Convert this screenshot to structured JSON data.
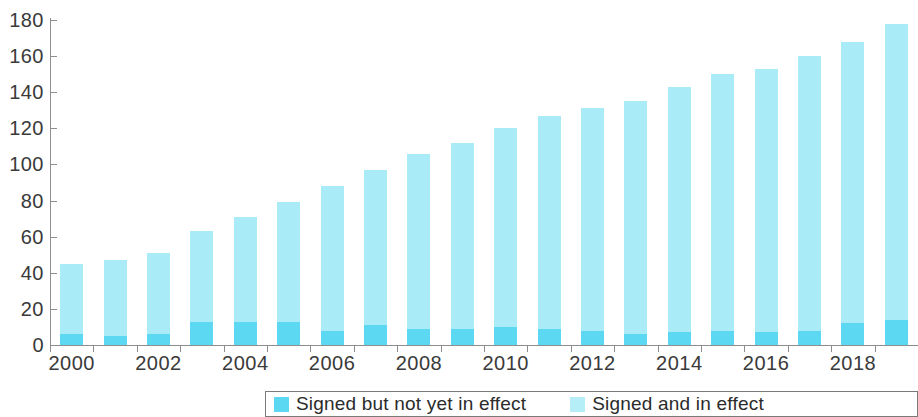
{
  "chart_data": {
    "type": "bar",
    "subtype": "stacked-bar",
    "title": "",
    "xlabel": "",
    "ylabel": "",
    "ylim": [
      0,
      180
    ],
    "yticks": [
      0,
      20,
      40,
      60,
      80,
      100,
      120,
      140,
      160,
      180
    ],
    "ytick_labels": [
      "0",
      "20",
      "40",
      "60",
      "80",
      "100",
      "120",
      "140",
      "160",
      "180"
    ],
    "grid": false,
    "legend_position": "bottom",
    "x": [
      2000,
      2001,
      2002,
      2003,
      2004,
      2005,
      2006,
      2007,
      2008,
      2009,
      2010,
      2011,
      2012,
      2013,
      2014,
      2015,
      2016,
      2017,
      2018,
      2019
    ],
    "categories": [
      "2000",
      "2001",
      "2002",
      "2003",
      "2004",
      "2005",
      "2006",
      "2007",
      "2008",
      "2009",
      "2010",
      "2011",
      "2012",
      "2013",
      "2014",
      "2015",
      "2016",
      "2017",
      "2018",
      "2019"
    ],
    "xtick_labels": [
      "2000",
      "2002",
      "2004",
      "2006",
      "2008",
      "2010",
      "2012",
      "2014",
      "2016",
      "2018"
    ],
    "xtick_values": [
      2000,
      2002,
      2004,
      2006,
      2008,
      2010,
      2012,
      2014,
      2016,
      2018
    ],
    "series": [
      {
        "name": "Signed but not yet in effect",
        "color": "#5cd8f2",
        "values": [
          6,
          5,
          6,
          13,
          13,
          13,
          8,
          11,
          9,
          9,
          10,
          9,
          8,
          6,
          7,
          8,
          7,
          8,
          12,
          14
        ]
      },
      {
        "name": "Signed and in effect",
        "color": "#a9ecf7",
        "values": [
          39,
          42,
          45,
          50,
          58,
          66,
          80,
          86,
          97,
          103,
          110,
          118,
          123,
          129,
          136,
          142,
          146,
          152,
          156,
          164
        ]
      }
    ],
    "totals": [
      45,
      47,
      51,
      63,
      71,
      79,
      88,
      97,
      106,
      112,
      120,
      127,
      131,
      135,
      143,
      150,
      153,
      160,
      168,
      178
    ]
  },
  "legend": {
    "items": [
      {
        "label": "Signed but not yet in effect",
        "color": "#5cd8f2"
      },
      {
        "label": "Signed and in effect",
        "color": "#b6eef7"
      }
    ]
  },
  "colors": {
    "signed_not_in_effect": "#5cd8f2",
    "signed_in_effect": "#a9ecf7",
    "axis": "#8e8e8e",
    "text": "#3a3a3a",
    "background": "#ffffff"
  }
}
